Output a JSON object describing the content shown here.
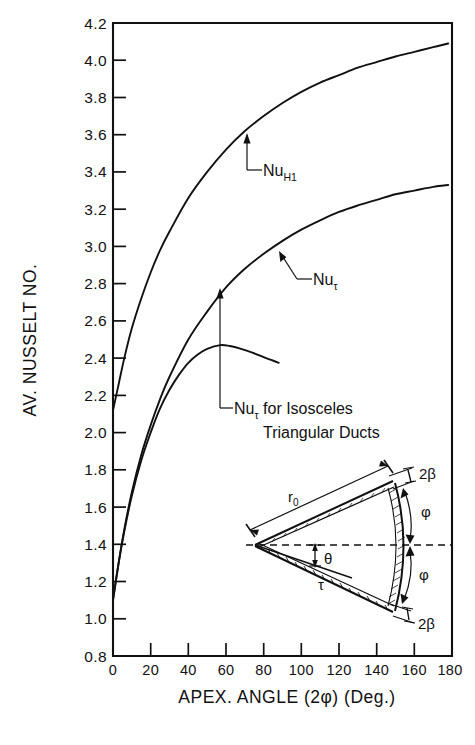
{
  "chart_data": {
    "type": "line",
    "title": "",
    "xlabel": "APEX. ANGLE (2φ) (Deg.)",
    "ylabel": "AV. NUSSELT NO.",
    "xlim": [
      0,
      180
    ],
    "ylim": [
      0.8,
      4.2
    ],
    "xticks": [
      0,
      20,
      40,
      60,
      80,
      100,
      120,
      140,
      160,
      180
    ],
    "xtick_labels": [
      "0",
      "20",
      "40",
      "60",
      "80",
      "100",
      "120",
      "140",
      "160",
      "180"
    ],
    "yticks": [
      0.8,
      1.0,
      1.2,
      1.4,
      1.6,
      1.8,
      2.0,
      2.2,
      2.4,
      2.6,
      2.8,
      3.0,
      3.2,
      3.4,
      3.6,
      3.8,
      4.0,
      4.2
    ],
    "ytick_labels": [
      "0.8",
      "1.0",
      "1.2",
      "1.4",
      "1.6",
      "1.8",
      "2.0",
      "2.2",
      "2.4",
      "2.6",
      "2.8",
      "3.0",
      "3.2",
      "3.4",
      "3.6",
      "3.8",
      "4.0",
      "4.2"
    ],
    "grid": false,
    "legend_position": "inline-annotations",
    "line_color": "#111111",
    "series": [
      {
        "name": "Nu_H1",
        "label": "Nu",
        "label_sub": "H1",
        "x": [
          0,
          3,
          6,
          10,
          15,
          20,
          25,
          30,
          40,
          50,
          60,
          70,
          80,
          90,
          100,
          110,
          120,
          130,
          140,
          150,
          160,
          170,
          178
        ],
        "y": [
          2.12,
          2.26,
          2.4,
          2.56,
          2.72,
          2.86,
          2.98,
          3.08,
          3.26,
          3.4,
          3.52,
          3.62,
          3.7,
          3.77,
          3.83,
          3.88,
          3.92,
          3.96,
          3.99,
          4.02,
          4.045,
          4.07,
          4.09
        ]
      },
      {
        "name": "Nu_tau",
        "label": "Nu",
        "label_sub": "τ",
        "x": [
          0,
          3,
          6,
          10,
          15,
          20,
          25,
          30,
          40,
          50,
          60,
          70,
          80,
          90,
          100,
          110,
          120,
          130,
          140,
          150,
          160,
          170,
          178
        ],
        "y": [
          1.1,
          1.3,
          1.48,
          1.68,
          1.88,
          2.04,
          2.18,
          2.3,
          2.5,
          2.65,
          2.78,
          2.88,
          2.96,
          3.03,
          3.09,
          3.14,
          3.185,
          3.22,
          3.25,
          3.28,
          3.3,
          3.32,
          3.33
        ]
      },
      {
        "name": "Nu_tau_isosceles",
        "label": "Nu",
        "label_sub": "τ",
        "label_suffix": " for Isosceles",
        "label_line2": "Triangular Ducts",
        "x": [
          0,
          3,
          6,
          10,
          15,
          20,
          25,
          30,
          35,
          40,
          45,
          50,
          57,
          62,
          68,
          74,
          80,
          84,
          88
        ],
        "y": [
          1.1,
          1.3,
          1.47,
          1.66,
          1.85,
          2.0,
          2.13,
          2.23,
          2.31,
          2.375,
          2.42,
          2.45,
          2.47,
          2.465,
          2.45,
          2.43,
          2.405,
          2.39,
          2.375
        ]
      }
    ],
    "annotations": [
      {
        "name": "nu-h1-annotation",
        "text": "Nu",
        "sub": "H1",
        "points_to_x": 48,
        "points_to_y": 3.42
      },
      {
        "name": "nu-tau-annotation",
        "text": "Nu",
        "sub": "τ",
        "points_to_x": 52,
        "points_to_y": 2.7
      },
      {
        "name": "nu-tau-isosceles-annotation",
        "text": "Nu",
        "sub": "τ",
        "suffix": " for Isosceles",
        "line2": "Triangular Ducts",
        "points_to_x": 57,
        "points_to_y": 2.47
      }
    ]
  },
  "inset": {
    "name": "wedge-duct-diagram",
    "labels": {
      "radius": "r",
      "radius_sub": "0",
      "beta_top": "2β",
      "beta_bottom": "2β",
      "phi_top": "φ",
      "phi_bottom": "φ",
      "theta": "θ",
      "tau": "τ"
    }
  }
}
